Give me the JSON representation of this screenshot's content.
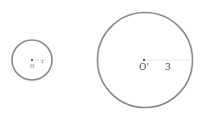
{
  "figure": {
    "circles": [
      {
        "id": "small",
        "center_label": "O",
        "radius_label": "1",
        "radius_value": 1
      },
      {
        "id": "large",
        "center_label": "O'",
        "radius_label": "3",
        "radius_value": 3
      }
    ],
    "colors": {
      "circle_stroke": "#8a8a8a",
      "radius_line": "#bdbdbd",
      "text": "#444444"
    }
  }
}
